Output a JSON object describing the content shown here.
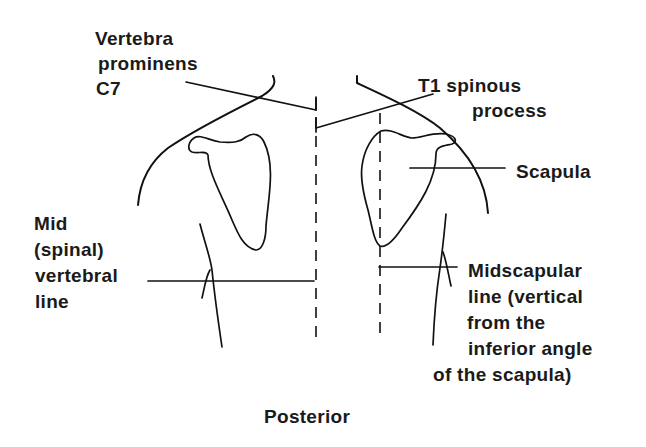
{
  "figure": {
    "view": "Posterior",
    "caption": "Posterior"
  },
  "labels": {
    "vertebra_prominens": {
      "lines": [
        "Vertebra",
        "prominens",
        "C7"
      ]
    },
    "t1_spinous_process": {
      "lines": [
        "T1 spinous",
        "process"
      ]
    },
    "scapula": {
      "lines": [
        "Scapula"
      ]
    },
    "mid_spinal_vertebral_line": {
      "lines": [
        "Mid",
        "(spinal)",
        "vertebral",
        "line"
      ]
    },
    "midscapular_line": {
      "lines": [
        "Midscapular",
        "line (vertical",
        "from the",
        "inferior angle",
        "of the scapula)"
      ]
    }
  },
  "colors": {
    "line": "#111111",
    "text": "#1a1a1a",
    "background": "#ffffff"
  }
}
